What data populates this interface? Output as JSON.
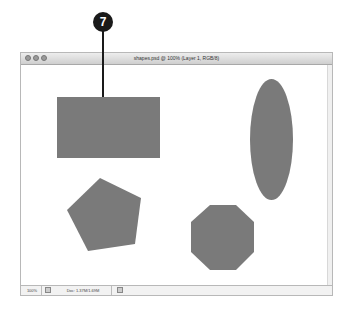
{
  "callout": {
    "number": "7"
  },
  "window": {
    "title": "shapes.psd @ 100% (Layer 1, RGB/8)",
    "controls": [
      "close",
      "minimize",
      "zoom"
    ]
  },
  "statusbar": {
    "zoom_level": "100%",
    "doc_info": "Doc: 1.37M/1.69M"
  },
  "canvas": {
    "shape_color": "#7a7a7a",
    "shapes": [
      {
        "type": "rectangle"
      },
      {
        "type": "ellipse"
      },
      {
        "type": "pentagon"
      },
      {
        "type": "octagon"
      }
    ]
  }
}
